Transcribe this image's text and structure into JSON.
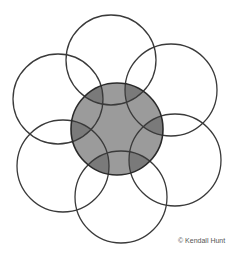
{
  "diagram": {
    "type": "overlapping-circles",
    "center_circle": {
      "cx": 117,
      "cy": 129,
      "r": 46,
      "fill": "#9b9b9b",
      "overlap_fill": "#7a7a7a"
    },
    "outer_circles": [
      {
        "name": "top",
        "cx": 111,
        "cy": 60,
        "r": 45
      },
      {
        "name": "upper-right",
        "cx": 171,
        "cy": 90,
        "r": 46
      },
      {
        "name": "lower-right",
        "cx": 175,
        "cy": 160,
        "r": 46
      },
      {
        "name": "bottom",
        "cx": 121,
        "cy": 197,
        "r": 46
      },
      {
        "name": "lower-left",
        "cx": 63,
        "cy": 166,
        "r": 46
      },
      {
        "name": "upper-left",
        "cx": 58,
        "cy": 99,
        "r": 45
      }
    ],
    "stroke": "#3a3a3a"
  },
  "credit": "© Kendall Hunt"
}
